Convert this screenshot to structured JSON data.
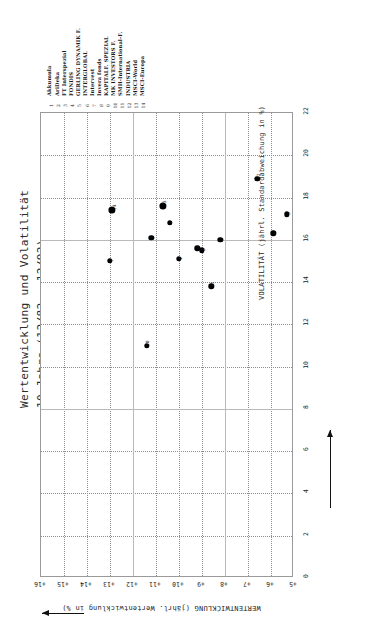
{
  "title": {
    "line1": "Wertentwicklung und Volatilität",
    "line2": "10 Jahre (12/82 - 12/92)"
  },
  "legend": {
    "items": [
      {
        "num": "1",
        "label": "Akkumula"
      },
      {
        "num": "2",
        "label": "AriDeka"
      },
      {
        "num": "3",
        "label": "FT Interspezial"
      },
      {
        "num": "4",
        "label": "FONDIS"
      },
      {
        "num": "5",
        "label": "GERLING DYNAMIK F."
      },
      {
        "num": "6",
        "label": "INTERGLOBAL"
      },
      {
        "num": "7",
        "label": "Intervest"
      },
      {
        "num": "8",
        "label": "Invera fonds"
      },
      {
        "num": "9",
        "label": "KAPITALF. SPEZIAL"
      },
      {
        "num": "10",
        "label": "MK INVESTORS F."
      },
      {
        "num": "11",
        "label": "SMH-International-F."
      },
      {
        "num": "12",
        "label": "INDUSTRIA"
      },
      {
        "num": "13",
        "label": "MSCI-World"
      },
      {
        "num": "14",
        "label": "MSCI-Europa"
      }
    ]
  },
  "axes": {
    "volatility_label": "VOLATILITÄT (jährl. Standardabweichung in %)",
    "volatility_ticks": [
      "0",
      "2",
      "4",
      "6",
      "8",
      "10",
      "12",
      "14",
      "16",
      "18",
      "20",
      "22"
    ],
    "performance_label": "WERTENTWICKLUNG (jährl. Wertentwicklung in %)",
    "performance_ticks": [
      "+16",
      "+15",
      "+14",
      "+13",
      "+12",
      "+11",
      "+10",
      "+9",
      "+8",
      "+7",
      "+6",
      "+5"
    ]
  },
  "colors": {
    "marker": "#000000",
    "grid": "#8d8d8d",
    "frame": "#9a9a9a",
    "text": "#1a1a1a"
  },
  "chart_data": {
    "type": "scatter",
    "title": "Wertentwicklung und Volatilität 10 Jahre (12/82 - 12/92)",
    "xlabel": "VOLATILITÄT (jährl. Standardabweichung in %)",
    "ylabel": "WERTENTWICKLUNG (jährl. Wertentwicklung in %)",
    "xlim": [
      0,
      22
    ],
    "ylim": [
      5,
      16
    ],
    "grid": true,
    "legend_position": "top",
    "points": [
      {
        "id": "1",
        "name": "Akkumula",
        "x": 15.0,
        "y": 13.0,
        "size": "medium"
      },
      {
        "id": "2",
        "name": "AriDeka",
        "x": 16.0,
        "y": 8.2,
        "size": "medium"
      },
      {
        "id": "3",
        "name": "FT Interspezial",
        "x": 17.2,
        "y": 5.3,
        "size": "medium"
      },
      {
        "id": "4",
        "name": "FONDIS",
        "x": 15.1,
        "y": 10.0,
        "size": "medium"
      },
      {
        "id": "5",
        "name": "GERLING DYNAMIK F.",
        "x": 16.1,
        "y": 11.2,
        "size": "medium"
      },
      {
        "id": "6",
        "name": "INTERGLOBAL",
        "x": 16.3,
        "y": 5.9,
        "size": "medium"
      },
      {
        "id": "7",
        "name": "Intervest",
        "x": 16.8,
        "y": 10.4,
        "size": "medium"
      },
      {
        "id": "8",
        "name": "Invera fonds",
        "x": 15.5,
        "y": 9.0,
        "size": "medium"
      },
      {
        "id": "9",
        "name": "KAPITALF. SPEZIAL",
        "x": 15.6,
        "y": 9.2,
        "size": "medium"
      },
      {
        "id": "10",
        "name": "MK INVESTORS F.",
        "x": 11.0,
        "y": 11.4,
        "size": "medium"
      },
      {
        "id": "11",
        "name": "SMH-International-F.",
        "x": 13.8,
        "y": 8.6,
        "size": "medium"
      },
      {
        "id": "12",
        "name": "INDUSTRIA",
        "x": 18.9,
        "y": 6.6,
        "size": "medium"
      },
      {
        "id": "13",
        "name": "MSCI-World",
        "x": 17.6,
        "y": 10.7,
        "size": "large"
      },
      {
        "id": "14",
        "name": "MSCI-Europa",
        "x": 17.4,
        "y": 12.9,
        "size": "large"
      }
    ]
  }
}
